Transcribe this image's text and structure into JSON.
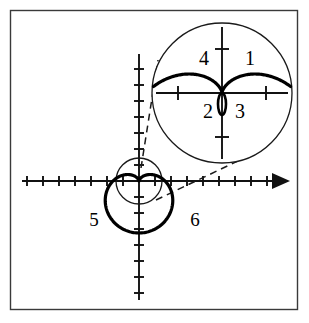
{
  "figure": {
    "background_color": "#ffffff",
    "frame": {
      "x": 10.5,
      "y": 10.5,
      "width": 287,
      "height": 299,
      "stroke_color": "#3a3a3a"
    },
    "axes": {
      "origin_x": 139,
      "origin_y": 181,
      "x_axis": {
        "start_x": 22,
        "end_x": 288,
        "arrow": true,
        "arrow_label": "x-axis-arrow"
      },
      "y_axis": {
        "start_y": 54,
        "end_y": 300,
        "arrow": false
      },
      "tick_spacing": 16,
      "tick_half_length": 5,
      "x_ticks_left": 7,
      "x_ticks_right": 8,
      "y_ticks_up": 8,
      "y_ticks_down": 7
    },
    "main_curve": {
      "name": "cardioid",
      "kind": "cardioid",
      "cusp_x": 139,
      "cusp_y": 181,
      "a": 26,
      "orientation": "downward",
      "stroke_color": "#000000",
      "stroke_width": 3.2
    },
    "generating_circle": {
      "name": "thin-generating-circle",
      "cx": 139,
      "cy": 181,
      "r": 23,
      "stroke_color": "#1a1a1a"
    },
    "magnifier": {
      "name": "magnified-inset",
      "cx": 222,
      "cy": 93,
      "r": 70,
      "zoom_factor": 2.9,
      "stroke_color": "#1a1a1a",
      "inner_axes": {
        "h_half_length": 66,
        "v_up": 66,
        "v_down": 66,
        "tick_half_length": 7,
        "tick_offset": 44
      },
      "inner_curve_a": 76,
      "inner_loop_rx": 4,
      "inner_loop_ry": 11
    },
    "leader_lines": [
      {
        "name": "leader-upper",
        "x1": 141,
        "y1": 168,
        "x2": 158,
        "y2": 60
      },
      {
        "name": "leader-lower",
        "x1": 156,
        "y1": 200,
        "x2": 240,
        "y2": 160
      }
    ],
    "labels": [
      {
        "id": "label-1",
        "text": "1",
        "x": 250,
        "y": 60
      },
      {
        "id": "label-4",
        "text": "4",
        "x": 204,
        "y": 60
      },
      {
        "id": "label-2",
        "text": "2",
        "x": 208,
        "y": 113
      },
      {
        "id": "label-3",
        "text": "3",
        "x": 240,
        "y": 113
      },
      {
        "id": "label-5",
        "text": "5",
        "x": 94,
        "y": 222
      },
      {
        "id": "label-6",
        "text": "6",
        "x": 195,
        "y": 222
      }
    ]
  }
}
